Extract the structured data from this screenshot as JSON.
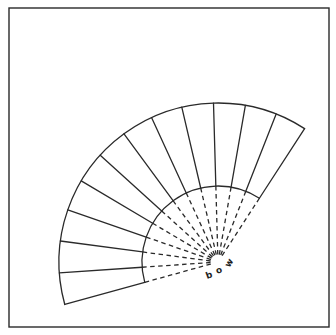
{
  "figure": {
    "type": "fan-diagram",
    "frame": {
      "left": 9,
      "top": 8,
      "right": 329,
      "bottom": 327
    },
    "pivot": {
      "x": 218,
      "y": 262
    },
    "inner_radius": 76,
    "outer_radius": 159,
    "start_angle_deg": 57,
    "end_angle_deg": 195.5,
    "panel_count": 12,
    "rib_count": 13,
    "line_color": "#2a2a2a",
    "labels": [
      {
        "text": "b",
        "x": 209,
        "y": 278,
        "rotate": -20
      },
      {
        "text": "o",
        "x": 219,
        "y": 273,
        "rotate": -20
      },
      {
        "text": "w",
        "x": 229,
        "y": 266,
        "rotate": -60
      }
    ]
  }
}
